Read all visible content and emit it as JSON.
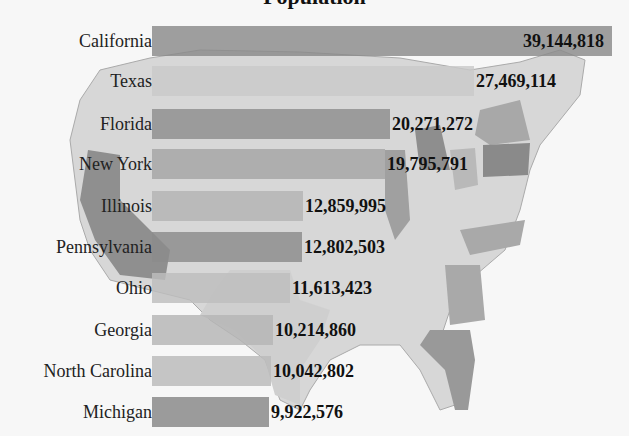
{
  "chart_data": {
    "type": "bar",
    "orientation": "horizontal",
    "title": "Population",
    "background": "grayscale map of the contiguous United States, top-10 states shaded darker",
    "categories": [
      "California",
      "Texas",
      "Florida",
      "New York",
      "Illinois",
      "Pennsylvania",
      "Ohio",
      "Georgia",
      "North Carolina",
      "Michigan"
    ],
    "values": [
      39144818,
      27469114,
      20271272,
      19795791,
      12859995,
      12802503,
      11613423,
      10214860,
      10042802,
      9922576
    ],
    "value_labels": [
      "39,144,818",
      "27,469,114",
      "20,271,272",
      "19,795,791",
      "12,859,995",
      "12,802,503",
      "11,613,423",
      "10,214,860",
      "10,042,802",
      "9,922,576"
    ],
    "xlabel": "",
    "ylabel": "",
    "grid": false,
    "legend": "none"
  },
  "title": "Population",
  "rows": [
    {
      "label": "California",
      "value": "39,144,818",
      "color": "#8a8a8a",
      "width": 460,
      "top": 26,
      "inside": true
    },
    {
      "label": "Texas",
      "value": "27,469,114",
      "color": "#c9c9c9",
      "width": 322,
      "top": 66
    },
    {
      "label": "Florida",
      "value": "20,271,272",
      "color": "#8e8e8e",
      "width": 238,
      "top": 109
    },
    {
      "label": "New York",
      "value": "19,795,791",
      "color": "#a5a5a5",
      "width": 233,
      "top": 149
    },
    {
      "label": "Illinois",
      "value": "12,859,995",
      "color": "#b3b3b3",
      "width": 151,
      "top": 191
    },
    {
      "label": "Pennsylvania",
      "value": "12,802,503",
      "color": "#8b8b8b",
      "width": 150,
      "top": 232
    },
    {
      "label": "Ohio",
      "value": "11,613,423",
      "color": "#bdbdbd",
      "width": 138,
      "top": 273
    },
    {
      "label": "Georgia",
      "value": "10,214,860",
      "color": "#b5b5b5",
      "width": 121,
      "top": 315
    },
    {
      "label": "North Carolina",
      "value": "10,042,802",
      "color": "#b9b9b9",
      "width": 119,
      "top": 356
    },
    {
      "label": "Michigan",
      "value": "9,922,576",
      "color": "#868686",
      "width": 117,
      "top": 397
    }
  ]
}
